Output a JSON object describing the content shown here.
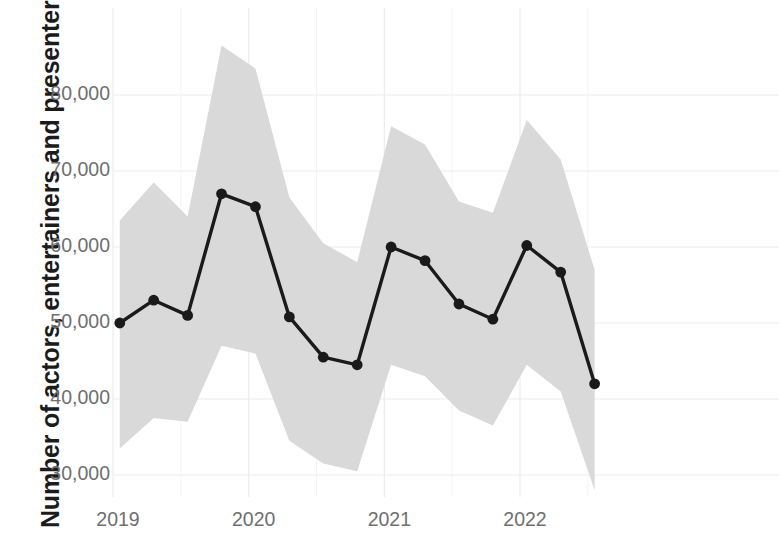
{
  "chart_data": {
    "type": "line",
    "title": "",
    "subtitle": "",
    "xlabel": "",
    "ylabel": "Number of actors, entertainers and presenters",
    "ylim": [
      28000,
      88000
    ],
    "xlim": [
      2018.9,
      2022.85
    ],
    "grid": true,
    "legend": null,
    "y_ticks": [
      30000,
      40000,
      50000,
      60000,
      70000,
      80000
    ],
    "y_tick_labels": [
      "30,000",
      "40,000",
      "50,000",
      "60,000",
      "70,000",
      "80,000"
    ],
    "x_ticks": [
      2019,
      2020,
      2021,
      2022
    ],
    "x_tick_labels": [
      "2019",
      "2020",
      "2021",
      "2022"
    ],
    "line_color": "#1a1a1a",
    "marker_color": "#1a1a1a",
    "band_color": "#d9d9d9",
    "band_label": "confidence interval",
    "x": [
      2019.05,
      2019.3,
      2019.55,
      2019.8,
      2020.05,
      2020.3,
      2020.55,
      2020.8,
      2021.05,
      2021.3,
      2021.55,
      2021.8,
      2022.05,
      2022.3,
      2022.55
    ],
    "series": [
      {
        "name": "Number of actors, entertainers and presenters",
        "values": [
          50000,
          53000,
          51000,
          67000,
          65300,
          50800,
          45500,
          44500,
          60000,
          58200,
          52500,
          50500,
          60200,
          56700,
          42000
        ]
      }
    ],
    "band_upper": [
      63500,
      68500,
      64000,
      86500,
      83500,
      66500,
      60500,
      58000,
      75900,
      73500,
      66000,
      64500,
      76700,
      71500,
      57000
    ],
    "band_lower": [
      33500,
      37500,
      37000,
      47000,
      46000,
      34500,
      31500,
      30500,
      44500,
      43000,
      38500,
      36500,
      44500,
      41000,
      28000
    ]
  }
}
